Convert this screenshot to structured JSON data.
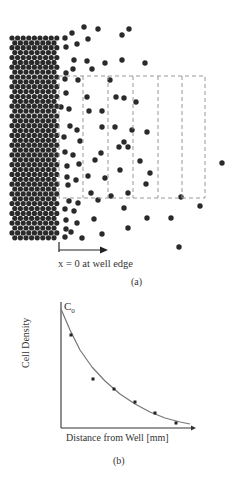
{
  "panel_a": {
    "caption": "(a)",
    "edge_label": "x = 0 at well edge",
    "dense_region": {
      "x0": 10,
      "x1": 60,
      "y0": 36,
      "y1": 240,
      "spacing": 5.6
    },
    "dot_color": "#2a2a2a",
    "dashed_box": {
      "x": 59,
      "y": 76,
      "width": 146,
      "height": 122,
      "dividers": [
        83,
        108,
        133,
        158,
        182
      ],
      "color": "#999999"
    },
    "scattered_dots": [
      [
        72,
        33
      ],
      [
        65,
        38
      ],
      [
        84,
        27
      ],
      [
        98,
        29
      ],
      [
        122,
        35
      ],
      [
        129,
        29
      ],
      [
        88,
        39
      ],
      [
        77,
        44
      ],
      [
        66,
        47
      ],
      [
        74,
        60
      ],
      [
        87,
        61
      ],
      [
        105,
        63
      ],
      [
        122,
        60
      ],
      [
        145,
        63
      ],
      [
        73,
        69
      ],
      [
        92,
        69
      ],
      [
        66,
        73
      ],
      [
        65,
        79
      ],
      [
        78,
        80
      ],
      [
        110,
        80
      ],
      [
        66,
        93
      ],
      [
        87,
        97
      ],
      [
        116,
        97
      ],
      [
        124,
        98
      ],
      [
        61,
        107
      ],
      [
        69,
        109
      ],
      [
        89,
        111
      ],
      [
        102,
        111
      ],
      [
        136,
        102
      ],
      [
        70,
        126
      ],
      [
        77,
        130
      ],
      [
        102,
        127
      ],
      [
        115,
        127
      ],
      [
        132,
        130
      ],
      [
        64,
        137
      ],
      [
        80,
        141
      ],
      [
        124,
        142
      ],
      [
        147,
        132
      ],
      [
        119,
        147
      ],
      [
        65,
        152
      ],
      [
        73,
        155
      ],
      [
        101,
        153
      ],
      [
        128,
        147
      ],
      [
        140,
        161
      ],
      [
        222,
        163
      ],
      [
        67,
        166
      ],
      [
        79,
        164
      ],
      [
        95,
        160
      ],
      [
        120,
        170
      ],
      [
        67,
        177
      ],
      [
        76,
        180
      ],
      [
        105,
        178
      ],
      [
        150,
        173
      ],
      [
        146,
        184
      ],
      [
        68,
        185
      ],
      [
        88,
        176
      ],
      [
        91,
        193
      ],
      [
        128,
        193
      ],
      [
        69,
        201
      ],
      [
        78,
        203
      ],
      [
        98,
        200
      ],
      [
        111,
        196
      ],
      [
        181,
        197
      ],
      [
        65,
        209
      ],
      [
        74,
        211
      ],
      [
        124,
        208
      ],
      [
        200,
        206
      ],
      [
        66,
        220
      ],
      [
        77,
        223
      ],
      [
        94,
        219
      ],
      [
        147,
        218
      ],
      [
        171,
        218
      ],
      [
        66,
        229
      ],
      [
        71,
        232
      ],
      [
        102,
        234
      ],
      [
        128,
        228
      ],
      [
        65,
        237
      ],
      [
        82,
        238
      ],
      [
        179,
        247
      ]
    ]
  },
  "panel_b": {
    "caption": "(b)",
    "curve_label": "C",
    "curve_label_sub": "0",
    "axes": {
      "origin_x": 61,
      "origin_y": 428,
      "y_top": 302,
      "x_right": 196,
      "color": "#333333"
    },
    "curve_color": "#777777",
    "curve_points": [
      [
        61,
        309
      ],
      [
        70,
        330
      ],
      [
        80,
        350
      ],
      [
        92,
        367
      ],
      [
        105,
        381
      ],
      [
        120,
        394
      ],
      [
        135,
        404
      ],
      [
        150,
        412
      ],
      [
        165,
        418
      ],
      [
        180,
        422
      ],
      [
        190,
        424
      ]
    ],
    "points_px": [
      [
        71,
        335
      ],
      [
        93,
        379
      ],
      [
        114,
        389
      ],
      [
        135,
        402
      ],
      [
        155,
        413
      ],
      [
        176,
        423
      ]
    ]
  },
  "chart_data": {
    "type": "scatter",
    "title": "",
    "xlabel": "Distance from Well [mm]",
    "ylabel": "Cell Density",
    "annotations": [
      "C0"
    ],
    "x": [
      1,
      2,
      3,
      4,
      5,
      6
    ],
    "values": [
      0.77,
      0.42,
      0.34,
      0.23,
      0.14,
      0.06
    ],
    "series": [
      {
        "name": "measured",
        "type": "scatter",
        "values": [
          0.77,
          0.42,
          0.34,
          0.23,
          0.14,
          0.06
        ]
      },
      {
        "name": "exponential fit",
        "type": "line",
        "values": [
          0.95,
          0.55,
          0.38,
          0.25,
          0.15,
          0.08
        ]
      }
    ],
    "grid": false,
    "legend": "none"
  }
}
